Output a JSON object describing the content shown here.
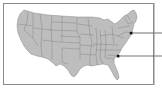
{
  "figure": {
    "type": "map",
    "region": "Contiguous United States",
    "style": "grayscale state outline map",
    "colors": {
      "land": "#bdbdbd",
      "state_borders": "#7a7a7a",
      "frame": "#8a8a8a",
      "markers": "#111111",
      "leaders": "#333333"
    },
    "markers": [
      {
        "id": "marker-northeast",
        "approx_location": "New Jersey / New York area",
        "x": 131,
        "y": 33,
        "leader_to_x": 162
      },
      {
        "id": "marker-southeast",
        "approx_location": "South Carolina / Georgia area",
        "x": 118,
        "y": 56,
        "leader_to_x": 162
      }
    ]
  }
}
